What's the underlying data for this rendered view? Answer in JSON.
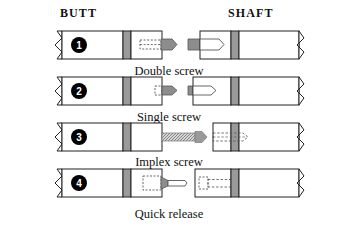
{
  "figure": {
    "title_hidden": "",
    "headers": {
      "butt": "BUTT",
      "shaft": "SHAFT"
    },
    "colors": {
      "outline": "#222222",
      "collar_band": "#9a9a9a",
      "screw_fill": "#8d8d8d",
      "badge": "#000000",
      "badge_text": "#ffffff",
      "body_fill": "#ffffff",
      "dashed_line": "#555555",
      "page_background": "#ffffff"
    },
    "rows": [
      {
        "number": "1",
        "caption": "Double screw",
        "joint_type": "double-screw",
        "butt_label": "BUTT",
        "shaft_label": "SHAFT",
        "butt_has_collar": true,
        "shaft_has_collar": true,
        "butt_pin": "solid-arrow-tenon",
        "shaft_pin": "hollow-arrow-socket"
      },
      {
        "number": "2",
        "caption": "Single screw",
        "joint_type": "single-screw",
        "butt_label": "BUTT",
        "shaft_label": "SHAFT",
        "butt_has_collar": true,
        "shaft_has_collar": true,
        "butt_pin": "short-solid-arrow",
        "shaft_pin": "short-hollow-arrow-socket"
      },
      {
        "number": "3",
        "caption": "Implex screw",
        "joint_type": "implex-screw",
        "butt_label": "BUTT",
        "shaft_label": "SHAFT",
        "butt_has_collar": true,
        "shaft_has_collar": true,
        "butt_pin": "long-hatched-arrow",
        "shaft_pin": "deep-dashed-socket"
      },
      {
        "number": "4",
        "caption": "Quick release",
        "joint_type": "quick-release",
        "butt_label": "BUTT",
        "shaft_label": "SHAFT",
        "butt_has_collar": true,
        "shaft_has_collar": true,
        "butt_pin": "quick-release-pin",
        "shaft_pin": "quick-release-socket"
      }
    ]
  }
}
